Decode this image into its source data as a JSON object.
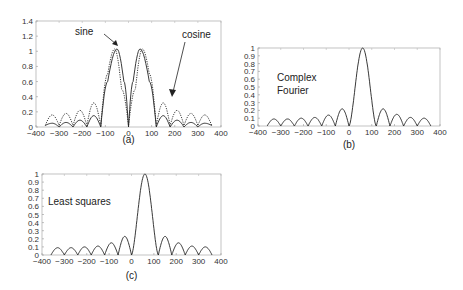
{
  "chart_data": [
    {
      "id": "a",
      "type": "line",
      "caption": "(a)",
      "xlim": [
        -400,
        400
      ],
      "ylim": [
        0,
        1.4
      ],
      "xticks": [
        -400,
        -300,
        -200,
        -100,
        0,
        100,
        200,
        300,
        400
      ],
      "yticks": [
        0,
        0.2,
        0.4,
        0.6,
        0.8,
        1,
        1.2,
        1.4
      ],
      "ytick_labels": [
        "0",
        "0.2",
        "0.4",
        "0.6",
        "0.8",
        "1",
        "1.2",
        "1.4"
      ],
      "grid": false,
      "annotations": [
        {
          "text": "sine",
          "x": -110,
          "y": 1.26
        },
        {
          "text": "cosine",
          "x": 225,
          "y": 1.18
        }
      ],
      "series": [
        {
          "name": "sine",
          "style": "dotted",
          "x": [
            -360,
            -330,
            -300,
            -270,
            -240,
            -210,
            -180,
            -150,
            -120,
            -90,
            -60,
            -30,
            0,
            30,
            60,
            90,
            120,
            150,
            180,
            210,
            240,
            270,
            300,
            330,
            360
          ],
          "y": [
            0.02,
            0.16,
            0.02,
            0.18,
            0.02,
            0.22,
            0.02,
            0.32,
            0.02,
            0.7,
            1.03,
            0.5,
            0.02,
            0.5,
            1.03,
            0.7,
            0.02,
            0.32,
            0.02,
            0.22,
            0.02,
            0.18,
            0.02,
            0.16,
            0.02
          ]
        },
        {
          "name": "cosine",
          "style": "solid",
          "x": [
            -360,
            -330,
            -300,
            -270,
            -240,
            -210,
            -180,
            -150,
            -120,
            -90,
            -50,
            -20,
            0,
            20,
            50,
            90,
            120,
            150,
            180,
            210,
            240,
            270,
            300,
            330,
            360
          ],
          "y": [
            0.02,
            0.05,
            0.0,
            0.06,
            0.0,
            0.09,
            0.0,
            0.15,
            0.0,
            0.6,
            1.03,
            0.6,
            0.0,
            0.6,
            1.03,
            0.6,
            0.0,
            0.15,
            0.0,
            0.09,
            0.0,
            0.06,
            0.0,
            0.05,
            0.02
          ]
        }
      ]
    },
    {
      "id": "b",
      "type": "line",
      "caption": "(b)",
      "label": [
        "Complex",
        "Fourier"
      ],
      "xlim": [
        -400,
        400
      ],
      "ylim": [
        0,
        1
      ],
      "xticks": [
        -400,
        -300,
        -200,
        -100,
        0,
        100,
        200,
        300,
        400
      ],
      "yticks": [
        0,
        0.1,
        0.2,
        0.3,
        0.4,
        0.5,
        0.6,
        0.7,
        0.8,
        0.9,
        1
      ],
      "ytick_labels": [
        "0",
        "0.1",
        "0.2",
        "0.3",
        "0.4",
        "0.5",
        "0.6",
        "0.7",
        "0.8",
        "0.9",
        "1"
      ],
      "grid": false,
      "series": [
        {
          "name": "Complex Fourier",
          "style": "solid",
          "peak_x": 60,
          "null_spacing": 60,
          "sidelobes": [
            0.09,
            0.09,
            0.1,
            0.11,
            0.14,
            0.22,
            1.0,
            0.22,
            0.15,
            0.11,
            0.1
          ]
        }
      ]
    },
    {
      "id": "c",
      "type": "line",
      "caption": "(c)",
      "label": [
        "Least squares"
      ],
      "xlim": [
        -400,
        400
      ],
      "ylim": [
        0,
        1
      ],
      "xticks": [
        -400,
        -300,
        -200,
        -100,
        0,
        100,
        200,
        300,
        400
      ],
      "yticks": [
        0,
        0.1,
        0.2,
        0.3,
        0.4,
        0.5,
        0.6,
        0.7,
        0.8,
        0.9,
        1
      ],
      "ytick_labels": [
        "0",
        "0.1",
        "0.2",
        "0.3",
        "0.4",
        "0.5",
        "0.6",
        "0.7",
        "0.8",
        "0.9",
        "1"
      ],
      "grid": false,
      "series": [
        {
          "name": "Least squares",
          "style": "solid",
          "peak_x": 60,
          "null_spacing": 60,
          "sidelobes": [
            0.09,
            0.09,
            0.1,
            0.11,
            0.15,
            0.23,
            1.0,
            0.23,
            0.15,
            0.11,
            0.1
          ]
        }
      ]
    }
  ]
}
